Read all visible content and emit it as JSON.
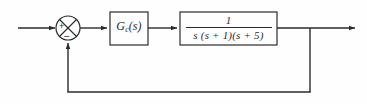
{
  "diagram": {
    "type": "control-system-block-diagram",
    "background_color": "#fefefe",
    "line_color": "#2b2b2b",
    "text_color": "#2b2b2b",
    "summing_junction": {
      "name": "summing-junction",
      "shape": "circle-with-cross",
      "center_x": 68,
      "center_y": 28,
      "radius": 12,
      "input_sign": "+",
      "feedback_sign": "−"
    },
    "blocks": [
      {
        "name": "controller-block",
        "label": "Gc(s)",
        "base": "G",
        "subscript": "c",
        "argument": "(s)",
        "x": 110,
        "y": 12,
        "width": 38,
        "height": 33
      },
      {
        "name": "plant-block",
        "label": "1 / s(s + 1)(s + 5)",
        "numerator": "1",
        "denominator": "s (s + 1)(s + 5)",
        "x": 180,
        "y": 12,
        "width": 97,
        "height": 33
      }
    ],
    "signals": {
      "input_arrow": "reference-input",
      "output_arrow": "plant-output",
      "feedback_branch_x": 310,
      "feedback_bottom_y": 92,
      "output_arrow_tip_x": 355,
      "main_line_y": 28
    }
  }
}
